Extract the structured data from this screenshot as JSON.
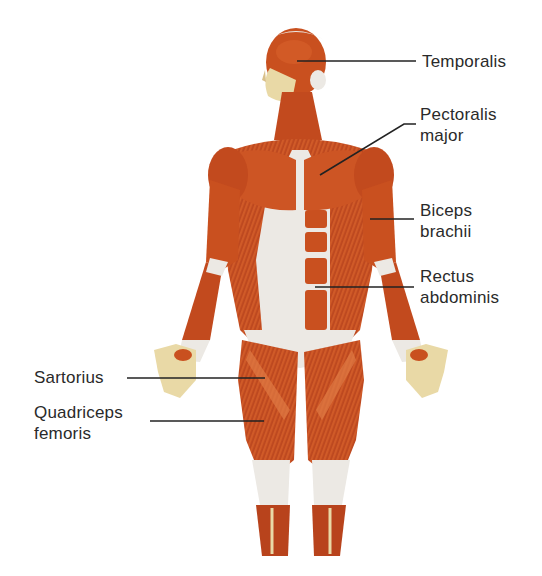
{
  "diagram": {
    "colors": {
      "muscle": "#c9501f",
      "muscle_dark": "#a8391a",
      "muscle_light": "#e07a45",
      "tendon": "#ece9e4",
      "skin": "#e9d9a6",
      "leader_line": "#222222",
      "label_text": "#2a2a2a"
    },
    "labels": [
      {
        "id": "temporalis",
        "lines": [
          "Temporalis"
        ],
        "side": "right"
      },
      {
        "id": "pectoralis-major",
        "lines": [
          "Pectoralis",
          "major"
        ],
        "side": "right"
      },
      {
        "id": "biceps-brachii",
        "lines": [
          "Biceps",
          "brachii"
        ],
        "side": "right"
      },
      {
        "id": "rectus-abdominis",
        "lines": [
          "Rectus",
          "abdominis"
        ],
        "side": "right"
      },
      {
        "id": "sartorius",
        "lines": [
          "Sartorius"
        ],
        "side": "left"
      },
      {
        "id": "quadriceps-femoris",
        "lines": [
          "Quadriceps",
          "femoris"
        ],
        "side": "left"
      }
    ]
  }
}
